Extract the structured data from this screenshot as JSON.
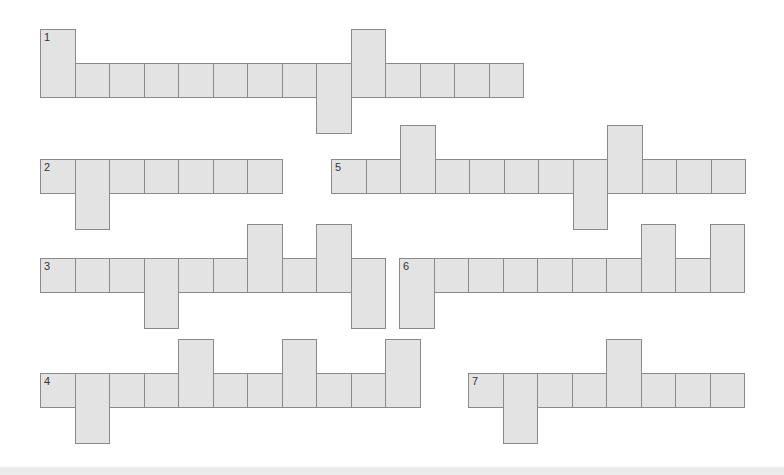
{
  "colors": {
    "background": "#ffffff",
    "cell_fill": "#e3e3e3",
    "cell_border": "#8a8a8a",
    "number_text": "#333333"
  },
  "grid": {
    "cell_width": 34.5,
    "cell_height": 35
  },
  "rows": [
    {
      "number": "1",
      "x": 40,
      "y": 63,
      "length": 14,
      "up": [
        1,
        10
      ],
      "down": [
        9
      ]
    },
    {
      "number": "2",
      "x": 40,
      "y": 159,
      "length": 7,
      "up": [],
      "down": [
        2
      ]
    },
    {
      "number": "3",
      "x": 40,
      "y": 258,
      "length": 10,
      "up": [
        7,
        9
      ],
      "down": [
        4,
        10
      ]
    },
    {
      "number": "4",
      "x": 40,
      "y": 373,
      "length": 11,
      "up": [
        5,
        8,
        11
      ],
      "down": [
        2
      ]
    },
    {
      "number": "5",
      "x": 331,
      "y": 159,
      "length": 12,
      "up": [
        3,
        9
      ],
      "down": [
        8
      ]
    },
    {
      "number": "6",
      "x": 399,
      "y": 258,
      "length": 10,
      "up": [
        8,
        10
      ],
      "down": [
        1
      ]
    },
    {
      "number": "7",
      "x": 468,
      "y": 373,
      "length": 8,
      "up": [
        5
      ],
      "down": [
        2
      ]
    }
  ]
}
